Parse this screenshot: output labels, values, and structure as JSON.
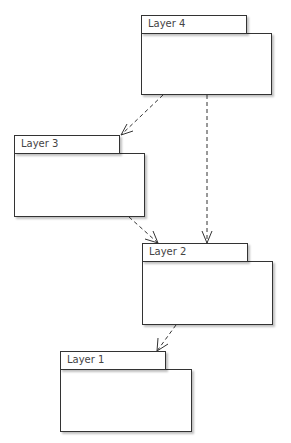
{
  "diagram": {
    "type": "package-dependency",
    "packages": [
      {
        "id": "layer4",
        "label": "Layer 4",
        "tab": {
          "x": 141,
          "y": 15,
          "w": 106,
          "h": 19
        },
        "body": {
          "x": 141,
          "y": 33,
          "w": 131,
          "h": 62
        }
      },
      {
        "id": "layer3",
        "label": "Layer 3",
        "tab": {
          "x": 14,
          "y": 135,
          "w": 106,
          "h": 19
        },
        "body": {
          "x": 14,
          "y": 153,
          "w": 131,
          "h": 64
        }
      },
      {
        "id": "layer2",
        "label": "Layer 2",
        "tab": {
          "x": 142,
          "y": 243,
          "w": 106,
          "h": 19
        },
        "body": {
          "x": 142,
          "y": 261,
          "w": 131,
          "h": 64
        }
      },
      {
        "id": "layer1",
        "label": "Layer 1",
        "tab": {
          "x": 60,
          "y": 351,
          "w": 106,
          "h": 19
        },
        "body": {
          "x": 60,
          "y": 369,
          "w": 132,
          "h": 63
        }
      }
    ],
    "dependencies": [
      {
        "from": "Layer 4",
        "to": "Layer 3",
        "style": "dashed-open-arrow"
      },
      {
        "from": "Layer 4",
        "to": "Layer 2",
        "style": "dashed-open-arrow"
      },
      {
        "from": "Layer 3",
        "to": "Layer 2",
        "style": "dashed-open-arrow"
      },
      {
        "from": "Layer 2",
        "to": "Layer 1",
        "style": "dashed-open-arrow"
      }
    ]
  }
}
